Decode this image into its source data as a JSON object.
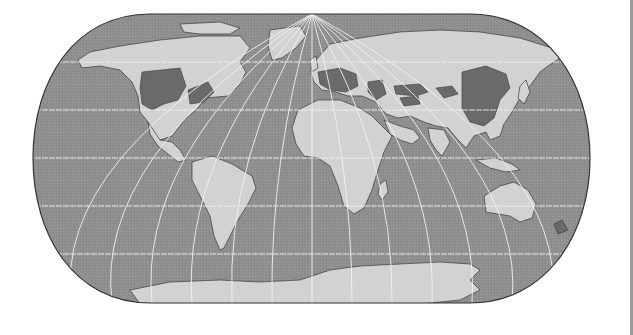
{
  "map": {
    "projection": "Eckert IV (pseudocylindrical)",
    "style": "grayscale",
    "colors": {
      "ocean": "#8f8f8f",
      "land": "#d2d2d2",
      "highlight": "#6a6a6a",
      "graticule": "#f2f2f2",
      "coast": "#3a3a3a",
      "border": "#333333",
      "page_edge": "#9a9a9a"
    },
    "highlighted_regions": [
      "Central United States",
      "Eastern United States",
      "Western and Central Europe",
      "Ukraine / Black Sea region",
      "Central Asian steppe bands",
      "Northeastern and Eastern China"
    ],
    "continents": [
      "North America",
      "South America",
      "Europe",
      "Africa",
      "Asia",
      "Australia",
      "Antarctica",
      "Greenland"
    ]
  }
}
